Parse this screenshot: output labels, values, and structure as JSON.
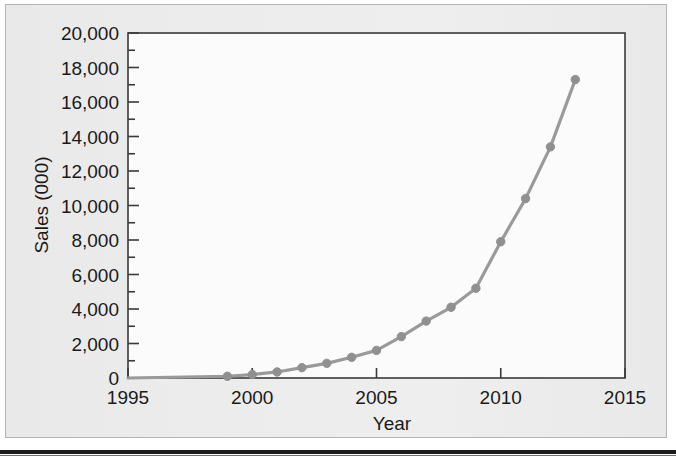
{
  "figure": {
    "background_color": "#e8e8e8",
    "plot_background_color": "#fbfbfb",
    "frame_color": "#3a3a3a",
    "series_color": "#9a9a9a",
    "marker_color": "#909090",
    "text_color": "#1a1a1a"
  },
  "axis": {
    "y_title": "Sales (000)",
    "x_title": "Year",
    "y_tick_labels": [
      "20,000",
      "18,000",
      "16,000",
      "14,000",
      "12,000",
      "10,000",
      "8,000",
      "6,000",
      "4,000",
      "2,000",
      "0"
    ],
    "x_tick_labels": [
      "1995",
      "2000",
      "2005",
      "2010",
      "2015"
    ]
  },
  "chart_data": {
    "type": "line",
    "title": "",
    "xlabel": "Year",
    "ylabel": "Sales (000)",
    "xlim": [
      1995,
      2015
    ],
    "ylim": [
      0,
      20000
    ],
    "x_tick_step": 5,
    "y_tick_step": 2000,
    "y_minor_tick_step": 1000,
    "grid": false,
    "legend": false,
    "markers": true,
    "series": [
      {
        "name": "Sales",
        "color": "#9a9a9a",
        "x": [
          1999,
          2000,
          2001,
          2002,
          2003,
          2004,
          2005,
          2006,
          2007,
          2008,
          2009,
          2010,
          2011,
          2012,
          2013
        ],
        "values": [
          100,
          200,
          350,
          600,
          850,
          1200,
          1600,
          2400,
          3300,
          4100,
          5200,
          7900,
          10400,
          13400,
          17300
        ]
      }
    ],
    "x": [
      1999,
      2000,
      2001,
      2002,
      2003,
      2004,
      2005,
      2006,
      2007,
      2008,
      2009,
      2010,
      2011,
      2012,
      2013
    ],
    "values": [
      100,
      200,
      350,
      600,
      850,
      1200,
      1600,
      2400,
      3300,
      4100,
      5200,
      7900,
      10400,
      13400,
      17300
    ]
  }
}
